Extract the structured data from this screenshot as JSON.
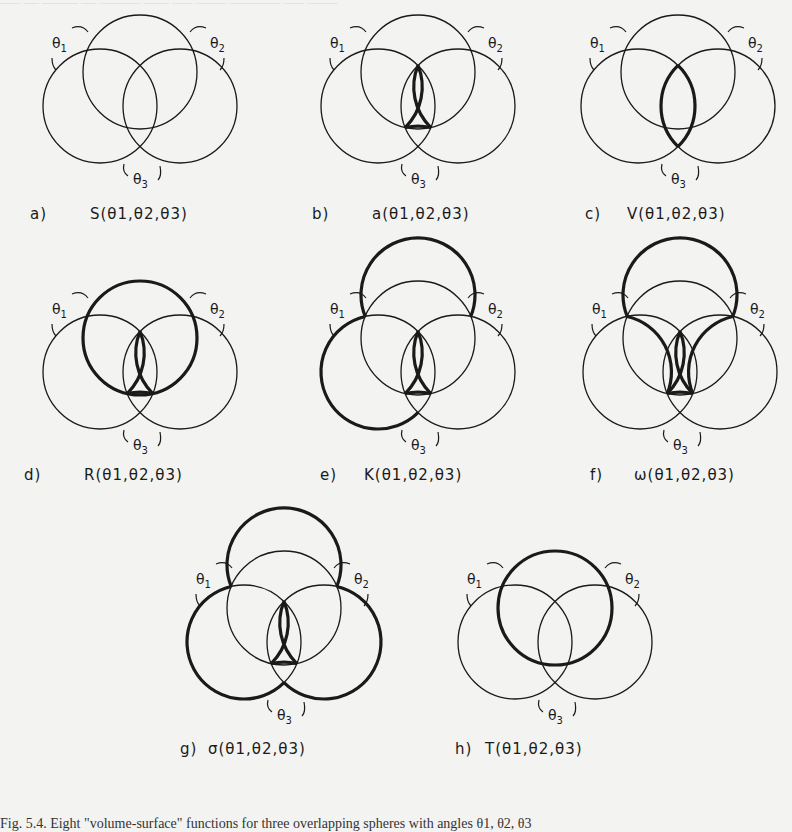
{
  "figure": {
    "panels": [
      {
        "tag": "a)",
        "func": "S",
        "args": "(θ₁,θ₂,θ₃)",
        "cx": 140,
        "cy": 72,
        "bold": []
      },
      {
        "tag": "b)",
        "func": "a",
        "args": "(θ₁,θ₂,θ₃)",
        "cx": 418,
        "cy": 72,
        "bold": [
          "center"
        ]
      },
      {
        "tag": "c)",
        "func": "V",
        "args": "(θ₁,θ₂,θ₃)",
        "cx": 678,
        "cy": 72,
        "bold": [
          "lens-vertical"
        ]
      },
      {
        "tag": "d)",
        "func": "R",
        "args": "(θ₁,θ₂,θ₃)",
        "cx": 140,
        "cy": 338,
        "bold": [
          "top-circle-outer",
          "center"
        ]
      },
      {
        "tag": "e)",
        "func": "K",
        "args": "(θ₁,θ₂,θ₃)",
        "cx": 418,
        "cy": 338,
        "bold": [
          "top-outer",
          "left-outer",
          "center"
        ]
      },
      {
        "tag": "f)",
        "func": "ω",
        "args": "(θ₁,θ₂,θ₃)",
        "cx": 680,
        "cy": 338,
        "bold": [
          "top-outer",
          "inner-tri",
          "center"
        ]
      },
      {
        "tag": "g)",
        "func": "σ",
        "args": "(θ₁,θ₂,θ₃)",
        "cx": 284,
        "cy": 608,
        "bold": [
          "outer-all",
          "center"
        ]
      },
      {
        "tag": "h)",
        "func": "T",
        "args": "(θ₁,θ₂,θ₃)",
        "cx": 555,
        "cy": 608,
        "bold": [
          "top-circle"
        ]
      }
    ],
    "angle_labels": [
      "θ1",
      "θ2",
      "θ3"
    ],
    "labels": [
      {
        "tag": "a)",
        "text": "S(θ1,θ2,θ3)"
      },
      {
        "tag": "b)",
        "text": "a(θ1,θ2,θ3)"
      },
      {
        "tag": "c)",
        "text": "V(θ1,θ2,θ3)"
      },
      {
        "tag": "d)",
        "text": "R(θ1,θ2,θ3)"
      },
      {
        "tag": "e)",
        "text": "K(θ1,θ2,θ3)"
      },
      {
        "tag": "f)",
        "text": "ω(θ1,θ2,θ3)"
      },
      {
        "tag": "g)",
        "text": "σ(θ1,θ2,θ3)"
      },
      {
        "tag": "h)",
        "text": "T(θ1,θ2,θ3)"
      }
    ],
    "caption": "Fig. 5.4. Eight \"volume-surface\" functions for three overlapping spheres with angles θ1, θ2, θ3"
  }
}
